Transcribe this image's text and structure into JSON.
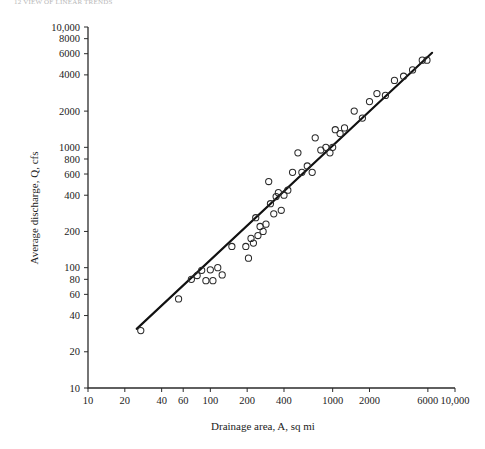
{
  "figure": {
    "top_caption": "12 VIEW OF LINEAR TRENDS",
    "background_color": "#ffffff",
    "line_color": "#111111",
    "marker_color": "#2a2a2a"
  },
  "chart_data": {
    "type": "scatter",
    "title": "",
    "subtitle": "",
    "xlabel": "Drainage area, A, sq mi",
    "ylabel": "Average discharge, Q, cfs",
    "xscale": "log",
    "yscale": "log",
    "xlim": [
      10,
      10000
    ],
    "ylim": [
      10,
      10000
    ],
    "grid": false,
    "legend": false,
    "xticks": [
      10,
      20,
      40,
      60,
      100,
      200,
      400,
      1000,
      2000,
      6000,
      10000
    ],
    "xticklabels": [
      "10",
      "20",
      "40",
      "60",
      "100",
      "200",
      "400",
      "1000",
      "2000",
      "6000",
      "10,000"
    ],
    "yticks": [
      10,
      20,
      40,
      60,
      80,
      100,
      200,
      400,
      600,
      800,
      1000,
      2000,
      4000,
      6000,
      8000,
      10000
    ],
    "yticklabels": [
      "10",
      "20",
      "40",
      "60",
      "80",
      "100",
      "200",
      "400",
      "600",
      "800",
      "1000",
      "2000",
      "4000",
      "6000",
      "8000",
      "10,000"
    ],
    "series": [
      {
        "name": "Observations",
        "marker": "open-circle",
        "x": [
          27,
          55,
          70,
          78,
          85,
          92,
          100,
          105,
          115,
          125,
          150,
          195,
          205,
          215,
          225,
          235,
          245,
          255,
          270,
          285,
          300,
          310,
          330,
          345,
          360,
          380,
          400,
          430,
          470,
          520,
          560,
          620,
          680,
          720,
          800,
          880,
          950,
          1000,
          1050,
          1150,
          1250,
          1500,
          1750,
          2000,
          2300,
          2700,
          3200,
          3800,
          4500,
          5400,
          5900
        ],
        "y": [
          30,
          55,
          80,
          86,
          95,
          78,
          96,
          78,
          100,
          87,
          150,
          150,
          120,
          175,
          160,
          260,
          185,
          220,
          200,
          230,
          520,
          340,
          280,
          390,
          420,
          300,
          400,
          440,
          620,
          900,
          620,
          700,
          620,
          1200,
          950,
          1000,
          900,
          1000,
          1400,
          1300,
          1450,
          2000,
          1750,
          2400,
          2800,
          2700,
          3600,
          3900,
          4400,
          5300,
          5300
        ]
      }
    ],
    "fit_line": {
      "name": "regression-line",
      "x": [
        25,
        6500
      ],
      "y": [
        31,
        6100
      ]
    }
  }
}
